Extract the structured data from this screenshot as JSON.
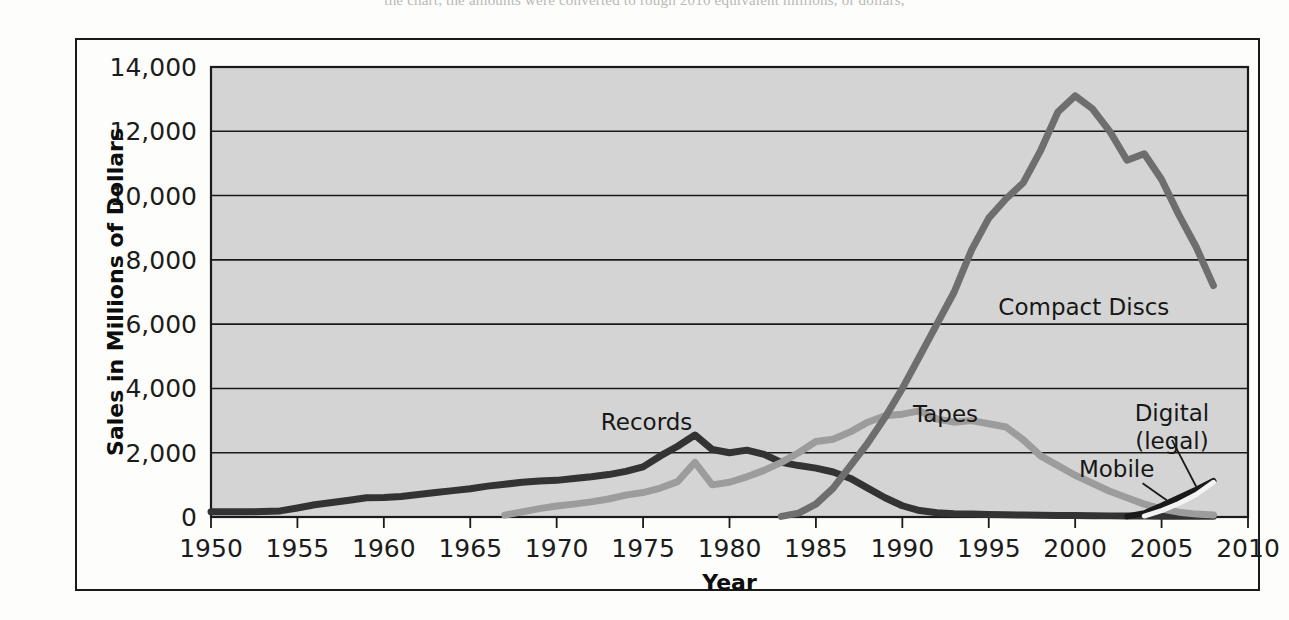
{
  "page": {
    "top_cut_text": "the chart, the amounts were converted to rough 2010 equivalent millions, or dollars,"
  },
  "chart_data": {
    "type": "line",
    "title": "",
    "xlabel": "Year",
    "ylabel": "Sales in Millions of Dollars",
    "xlim": [
      1950,
      2010
    ],
    "ylim": [
      0,
      14000
    ],
    "grid": true,
    "legend_position": "inline-labels",
    "xticks": [
      "1950",
      "1955",
      "1960",
      "1965",
      "1970",
      "1975",
      "1980",
      "1985",
      "1990",
      "1995",
      "2000",
      "2005",
      "2010"
    ],
    "yticks": [
      "0",
      "2,000",
      "4,000",
      "6,000",
      "8,000",
      "10,000",
      "12,000",
      "14,000"
    ],
    "plot_background": "#d4d4d4",
    "series": [
      {
        "name": "Records",
        "color": "#333333",
        "width": 7,
        "label_x": 1975.2,
        "label_y": 2700,
        "points": [
          [
            1950,
            160
          ],
          [
            1951,
            160
          ],
          [
            1952,
            160
          ],
          [
            1953,
            170
          ],
          [
            1954,
            190
          ],
          [
            1955,
            280
          ],
          [
            1956,
            380
          ],
          [
            1957,
            450
          ],
          [
            1958,
            520
          ],
          [
            1959,
            600
          ],
          [
            1960,
            610
          ],
          [
            1961,
            640
          ],
          [
            1962,
            700
          ],
          [
            1963,
            760
          ],
          [
            1964,
            820
          ],
          [
            1965,
            880
          ],
          [
            1966,
            960
          ],
          [
            1967,
            1020
          ],
          [
            1968,
            1080
          ],
          [
            1969,
            1120
          ],
          [
            1970,
            1140
          ],
          [
            1971,
            1200
          ],
          [
            1972,
            1250
          ],
          [
            1973,
            1320
          ],
          [
            1974,
            1420
          ],
          [
            1975,
            1560
          ],
          [
            1976,
            1900
          ],
          [
            1977,
            2200
          ],
          [
            1978,
            2550
          ],
          [
            1979,
            2100
          ],
          [
            1980,
            2000
          ],
          [
            1981,
            2080
          ],
          [
            1982,
            1950
          ],
          [
            1983,
            1700
          ],
          [
            1984,
            1600
          ],
          [
            1985,
            1520
          ],
          [
            1986,
            1400
          ],
          [
            1987,
            1200
          ],
          [
            1988,
            900
          ],
          [
            1989,
            600
          ],
          [
            1990,
            350
          ],
          [
            1991,
            200
          ],
          [
            1992,
            130
          ],
          [
            1993,
            100
          ],
          [
            1994,
            90
          ],
          [
            1995,
            80
          ],
          [
            1996,
            70
          ],
          [
            1997,
            60
          ],
          [
            1998,
            55
          ],
          [
            1999,
            50
          ],
          [
            2000,
            45
          ],
          [
            2001,
            40
          ],
          [
            2002,
            35
          ],
          [
            2003,
            30
          ],
          [
            2004,
            28
          ],
          [
            2005,
            25
          ],
          [
            2006,
            25
          ],
          [
            2007,
            25
          ],
          [
            2008,
            25
          ]
        ]
      },
      {
        "name": "Tapes",
        "color": "#9c9c9c",
        "width": 7,
        "label_x": 1992.5,
        "label_y": 2950,
        "points": [
          [
            1967,
            60
          ],
          [
            1968,
            160
          ],
          [
            1969,
            260
          ],
          [
            1970,
            340
          ],
          [
            1971,
            400
          ],
          [
            1972,
            470
          ],
          [
            1973,
            560
          ],
          [
            1974,
            680
          ],
          [
            1975,
            760
          ],
          [
            1976,
            900
          ],
          [
            1977,
            1100
          ],
          [
            1978,
            1700
          ],
          [
            1979,
            1000
          ],
          [
            1980,
            1080
          ],
          [
            1981,
            1250
          ],
          [
            1982,
            1450
          ],
          [
            1983,
            1700
          ],
          [
            1984,
            2000
          ],
          [
            1985,
            2350
          ],
          [
            1986,
            2420
          ],
          [
            1987,
            2650
          ],
          [
            1988,
            2950
          ],
          [
            1989,
            3150
          ],
          [
            1990,
            3200
          ],
          [
            1991,
            3300
          ],
          [
            1992,
            3050
          ],
          [
            1993,
            2950
          ],
          [
            1994,
            3000
          ],
          [
            1995,
            2900
          ],
          [
            1996,
            2800
          ],
          [
            1997,
            2400
          ],
          [
            1998,
            1900
          ],
          [
            1999,
            1600
          ],
          [
            2000,
            1300
          ],
          [
            2001,
            1050
          ],
          [
            2002,
            800
          ],
          [
            2003,
            600
          ],
          [
            2004,
            400
          ],
          [
            2005,
            250
          ],
          [
            2006,
            150
          ],
          [
            2007,
            90
          ],
          [
            2008,
            60
          ]
        ]
      },
      {
        "name": "Compact Discs",
        "color": "#6e6e6e",
        "width": 7,
        "label_x": 2000.5,
        "label_y": 6300,
        "points": [
          [
            1983,
            20
          ],
          [
            1984,
            120
          ],
          [
            1985,
            400
          ],
          [
            1986,
            900
          ],
          [
            1987,
            1600
          ],
          [
            1988,
            2300
          ],
          [
            1989,
            3100
          ],
          [
            1990,
            4000
          ],
          [
            1991,
            5000
          ],
          [
            1992,
            6000
          ],
          [
            1993,
            7000
          ],
          [
            1994,
            8300
          ],
          [
            1995,
            9300
          ],
          [
            1996,
            9900
          ],
          [
            1997,
            10400
          ],
          [
            1998,
            11400
          ],
          [
            1999,
            12600
          ],
          [
            2000,
            13100
          ],
          [
            2001,
            12700
          ],
          [
            2002,
            12000
          ],
          [
            2003,
            11100
          ],
          [
            2004,
            11300
          ],
          [
            2005,
            10500
          ],
          [
            2006,
            9400
          ],
          [
            2007,
            8400
          ],
          [
            2008,
            7200
          ]
        ]
      },
      {
        "name": "Digital (legal)",
        "color": "#1a1a1a",
        "width": 6,
        "label_x": 2005.6,
        "label_y": 3000,
        "points": [
          [
            2003,
            20
          ],
          [
            2004,
            120
          ],
          [
            2005,
            350
          ],
          [
            2006,
            600
          ],
          [
            2007,
            850
          ],
          [
            2008,
            1120
          ]
        ]
      },
      {
        "name": "Mobile",
        "color": "#f4f4f4",
        "width": 5,
        "label_x": 2002.4,
        "label_y": 1250,
        "points": [
          [
            2004,
            30
          ],
          [
            2005,
            200
          ],
          [
            2006,
            420
          ],
          [
            2007,
            700
          ],
          [
            2008,
            1080
          ]
        ]
      }
    ]
  }
}
